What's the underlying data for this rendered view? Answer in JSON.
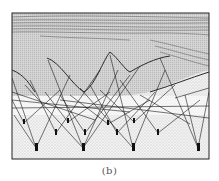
{
  "figure": {
    "caption": "(b)",
    "frame": {
      "x": 12,
      "y": 13,
      "w": 197,
      "h": 146
    },
    "colors": {
      "ink": "#1a1a1a",
      "frame": "#222222",
      "paper": "#ffffff",
      "stipple": "#9a9a9a"
    },
    "anchors": [
      {
        "x": 24,
        "y": 123
      },
      {
        "x": 56,
        "y": 133
      },
      {
        "x": 36,
        "y": 148
      },
      {
        "x": 83,
        "y": 148
      },
      {
        "x": 85,
        "y": 133
      },
      {
        "x": 117,
        "y": 133
      },
      {
        "x": 133,
        "y": 148
      },
      {
        "x": 158,
        "y": 133
      },
      {
        "x": 198,
        "y": 148
      },
      {
        "x": 134,
        "y": 122
      },
      {
        "x": 68,
        "y": 122
      },
      {
        "x": 108,
        "y": 124
      }
    ]
  }
}
